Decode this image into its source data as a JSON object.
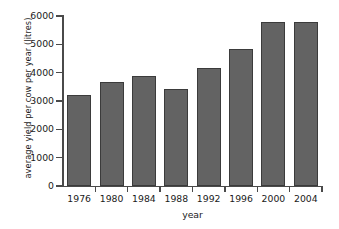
{
  "chart_data": {
    "type": "bar",
    "title": "",
    "xlabel": "year",
    "ylabel": "average yield per cow per year (litres)",
    "categories": [
      "1976",
      "1980",
      "1984",
      "1988",
      "1992",
      "1996",
      "2000",
      "2004"
    ],
    "values": [
      3200,
      3680,
      3880,
      3420,
      4180,
      4850,
      5800,
      5800
    ],
    "ylim": [
      0,
      6000
    ],
    "yticks": [
      0,
      1000,
      2000,
      3000,
      4000,
      5000,
      6000
    ],
    "ytick_labels": [
      "0",
      "1000",
      "2000",
      "3000",
      "4000",
      "5000",
      "6000"
    ],
    "grid": false,
    "legend": null,
    "series": [
      {
        "name": "average yield per cow per year (litres)",
        "values": [
          3200,
          3680,
          3880,
          3420,
          4180,
          4850,
          5800,
          5800
        ]
      }
    ],
    "colors": {
      "bar_fill": "#636363",
      "bar_edge": "#3b3b3b",
      "axis": "#4a4a4a",
      "background": "#ffffff",
      "text": "#1a1a1a"
    }
  }
}
